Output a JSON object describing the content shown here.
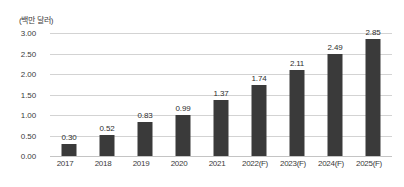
{
  "chart_data": {
    "type": "bar",
    "title": "",
    "subtitle": "",
    "unit_caption": "(백만 달러)",
    "xlabel": "",
    "ylabel": "",
    "categories": [
      "2017",
      "2018",
      "2019",
      "2020",
      "2021",
      "2022(F)",
      "2023(F)",
      "2024(F)",
      "2025(F)"
    ],
    "values": [
      0.3,
      0.52,
      0.83,
      0.99,
      1.37,
      1.74,
      2.11,
      2.49,
      2.85
    ],
    "value_labels": [
      "0.30",
      "0.52",
      "0.83",
      "0.99",
      "1.37",
      "1.74",
      "2.11",
      "2.49",
      "2.85"
    ],
    "ylim": [
      0.0,
      3.0
    ],
    "ytick_labels": [
      "0.00",
      "0.50",
      "1.00",
      "1.50",
      "2.00",
      "2.50",
      "3.00"
    ],
    "ytick_values": [
      0.0,
      0.5,
      1.0,
      1.5,
      2.0,
      2.5,
      3.0
    ],
    "grid": true,
    "grid_axis": "y",
    "legend": false,
    "legend_position": "none",
    "bar_color": "#3a3a3a",
    "grid_color": "#d3d3d3",
    "background_color": "#ffffff",
    "text_color": "#3b3b3b"
  }
}
